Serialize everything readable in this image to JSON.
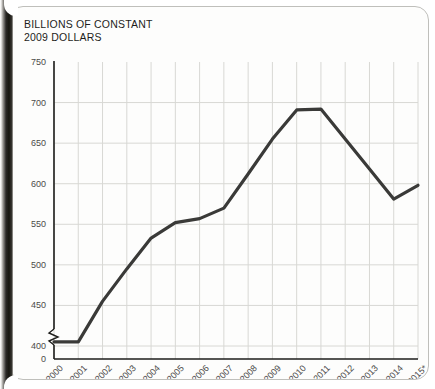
{
  "chart_data": {
    "type": "line",
    "title": "BILLIONS OF CONSTANT\n2009 DOLLARS",
    "xlabel": "",
    "ylabel": "",
    "categories": [
      "2000",
      "2001",
      "2002",
      "2003",
      "2004",
      "2005",
      "2006",
      "2007",
      "2008",
      "2009",
      "2010",
      "2011",
      "2012",
      "2013",
      "2014",
      "2015*"
    ],
    "x": [
      2000,
      2001,
      2002,
      2003,
      2004,
      2005,
      2006,
      2007,
      2008,
      2009,
      2010,
      2011,
      2012,
      2013,
      2014,
      2015
    ],
    "values": [
      405,
      405,
      455,
      495,
      533,
      552,
      557,
      570,
      612,
      655,
      691,
      692,
      655,
      618,
      581,
      598
    ],
    "series": [
      {
        "name": "Constant 2009 dollars",
        "values": [
          405,
          405,
          455,
          495,
          533,
          552,
          557,
          570,
          612,
          655,
          691,
          692,
          655,
          618,
          581,
          598
        ]
      }
    ],
    "ytick_labels": [
      "750",
      "700",
      "650",
      "600",
      "550",
      "500",
      "450",
      "400",
      "0"
    ],
    "ytick_values": [
      750,
      700,
      650,
      600,
      550,
      500,
      450,
      400,
      0
    ],
    "ylim": [
      400,
      750
    ],
    "axis_break": true,
    "axis_break_note": "y-axis broken between 0 and 400",
    "grid": true,
    "legend": null,
    "line_color": "#3a3a38",
    "grid_color": "#d8d8d4",
    "axis_color": "#1d1d1b",
    "footnote_marker": "*"
  },
  "figure": {
    "title_line1": "BILLIONS OF CONSTANT",
    "title_line2": "2009 DOLLARS"
  }
}
